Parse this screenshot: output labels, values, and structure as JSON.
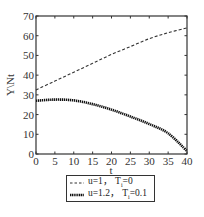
{
  "chart_data": {
    "type": "line",
    "title": "",
    "xlabel": "t",
    "ylabel": "Y\\Nt",
    "xlim": [
      0,
      40
    ],
    "ylim": [
      0,
      70
    ],
    "xticks": [
      0,
      5,
      10,
      15,
      20,
      25,
      30,
      35,
      40
    ],
    "yticks": [
      0,
      10,
      20,
      30,
      40,
      50,
      60,
      70
    ],
    "grid": false,
    "legend_position": "below plot",
    "x": [
      0,
      5,
      10,
      15,
      20,
      25,
      30,
      35,
      40
    ],
    "series": [
      {
        "name": "u=1, Tᵢ=0",
        "style": "dashed",
        "color": "#333333",
        "values": [
          32.5,
          37,
          41.5,
          46,
          50.5,
          54.5,
          58.5,
          61.5,
          64
        ]
      },
      {
        "name": "u=1.2, Tᵢ=0.1",
        "style": "thick-dotted",
        "color": "#111111",
        "values": [
          27,
          27.6,
          27.2,
          25.3,
          22.5,
          19,
          15.2,
          10.5,
          1.5
        ]
      }
    ]
  },
  "axes": {
    "xlabel": "t",
    "ylabel": "Y\\Nt",
    "xtick_labels": [
      "0",
      "5",
      "10",
      "15",
      "20",
      "25",
      "30",
      "35",
      "40"
    ],
    "ytick_labels": [
      "0",
      "10",
      "20",
      "30",
      "40",
      "50",
      "60",
      "70"
    ]
  },
  "legend": {
    "entries": [
      {
        "label_main": "u=1， T",
        "label_sub": "i",
        "label_tail": "=0"
      },
      {
        "label_main": "u=1.2， T",
        "label_sub": "i",
        "label_tail": "=0.1"
      }
    ]
  }
}
